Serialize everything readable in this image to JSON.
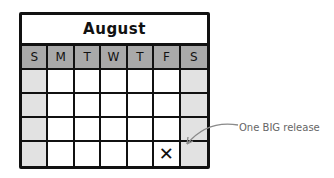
{
  "calendar": {
    "month": "August",
    "weekdays": [
      "S",
      "M",
      "T",
      "W",
      "T",
      "F",
      "S"
    ],
    "weeks": 4,
    "marked_cell": {
      "week": 3,
      "day": 5,
      "mark": "✕"
    }
  },
  "annotation": {
    "text": "One BIG release"
  },
  "colors": {
    "header_bg": "#a9a9a9",
    "weekend_bg": "#e2e2e2",
    "line": "#111111",
    "annotation": "#666666"
  }
}
